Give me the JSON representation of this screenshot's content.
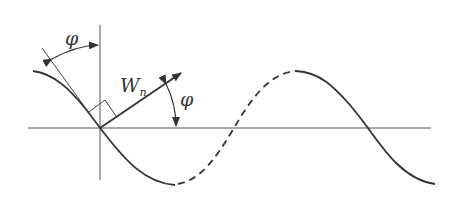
{
  "diagram": {
    "type": "wave-phase-vector",
    "labels": {
      "phi_top": "φ",
      "phi_right": "φ",
      "wn_main": "W",
      "wn_sub": "n"
    },
    "colors": {
      "line": "#333333",
      "axis": "#555555",
      "background": "#ffffff"
    },
    "elements": [
      "horizontal axis",
      "vertical axis",
      "sinusoidal wave (solid segments and dashed segment)",
      "tangent line at origin",
      "normal vector W_n with arrow",
      "right-angle marker",
      "angle phi arc between tangent and vertical",
      "angle phi arc between W_n and horizontal"
    ]
  }
}
